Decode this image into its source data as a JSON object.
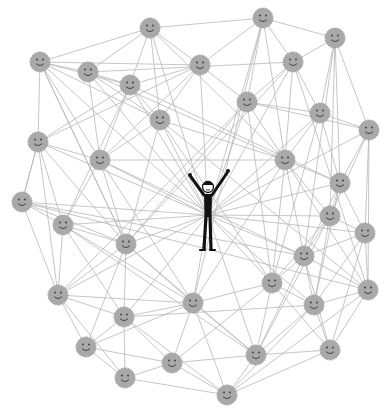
{
  "illustration": {
    "subject": "network of smiling people around a central cheering figure",
    "colors": {
      "background": "#ffffff",
      "edge": "#b8b8b8",
      "node_fill": "#a9a9a9",
      "node_stroke": "#9a9a9a",
      "face_ink": "#3a3a3a",
      "figure": "#111111"
    },
    "node_radius": 10,
    "center_figure": {
      "x": 208,
      "y": 215,
      "label": "central-person"
    },
    "nodes": [
      {
        "x": 150,
        "y": 28
      },
      {
        "x": 263,
        "y": 18
      },
      {
        "x": 335,
        "y": 38
      },
      {
        "x": 40,
        "y": 62
      },
      {
        "x": 88,
        "y": 72
      },
      {
        "x": 200,
        "y": 65
      },
      {
        "x": 293,
        "y": 62
      },
      {
        "x": 130,
        "y": 85
      },
      {
        "x": 247,
        "y": 102
      },
      {
        "x": 320,
        "y": 113
      },
      {
        "x": 369,
        "y": 130
      },
      {
        "x": 160,
        "y": 120
      },
      {
        "x": 38,
        "y": 142
      },
      {
        "x": 100,
        "y": 160
      },
      {
        "x": 285,
        "y": 160
      },
      {
        "x": 340,
        "y": 183
      },
      {
        "x": 22,
        "y": 202
      },
      {
        "x": 330,
        "y": 216
      },
      {
        "x": 63,
        "y": 225
      },
      {
        "x": 365,
        "y": 233
      },
      {
        "x": 126,
        "y": 244
      },
      {
        "x": 304,
        "y": 256
      },
      {
        "x": 272,
        "y": 283
      },
      {
        "x": 58,
        "y": 295
      },
      {
        "x": 193,
        "y": 303
      },
      {
        "x": 314,
        "y": 305
      },
      {
        "x": 368,
        "y": 290
      },
      {
        "x": 124,
        "y": 317
      },
      {
        "x": 86,
        "y": 347
      },
      {
        "x": 256,
        "y": 355
      },
      {
        "x": 330,
        "y": 350
      },
      {
        "x": 125,
        "y": 378
      },
      {
        "x": 172,
        "y": 363
      },
      {
        "x": 227,
        "y": 395
      }
    ],
    "edges": [
      [
        0,
        3
      ],
      [
        0,
        4
      ],
      [
        0,
        5
      ],
      [
        0,
        7
      ],
      [
        0,
        11
      ],
      [
        0,
        1
      ],
      [
        0,
        14
      ],
      [
        1,
        2
      ],
      [
        1,
        5
      ],
      [
        1,
        6
      ],
      [
        1,
        8
      ],
      [
        1,
        14
      ],
      [
        1,
        24
      ],
      [
        2,
        6
      ],
      [
        2,
        9
      ],
      [
        2,
        10
      ],
      [
        2,
        15
      ],
      [
        2,
        17
      ],
      [
        2,
        21
      ],
      [
        3,
        4
      ],
      [
        3,
        5
      ],
      [
        3,
        7
      ],
      [
        3,
        12
      ],
      [
        3,
        11
      ],
      [
        3,
        13
      ],
      [
        3,
        20
      ],
      [
        4,
        7
      ],
      [
        4,
        11
      ],
      [
        4,
        13
      ],
      [
        4,
        6
      ],
      [
        4,
        14
      ],
      [
        5,
        7
      ],
      [
        5,
        11
      ],
      [
        5,
        8
      ],
      [
        5,
        13
      ],
      [
        5,
        12
      ],
      [
        6,
        8
      ],
      [
        6,
        9
      ],
      [
        6,
        14
      ],
      [
        6,
        20
      ],
      [
        7,
        11
      ],
      [
        7,
        13
      ],
      [
        7,
        12
      ],
      [
        7,
        18
      ],
      [
        7,
        15
      ],
      [
        8,
        9
      ],
      [
        8,
        14
      ],
      [
        8,
        10
      ],
      [
        8,
        20
      ],
      [
        8,
        23
      ],
      [
        9,
        10
      ],
      [
        9,
        14
      ],
      [
        9,
        15
      ],
      [
        9,
        22
      ],
      [
        10,
        15
      ],
      [
        10,
        17
      ],
      [
        10,
        19
      ],
      [
        10,
        26
      ],
      [
        11,
        13
      ],
      [
        11,
        14
      ],
      [
        11,
        20
      ],
      [
        11,
        22
      ],
      [
        12,
        13
      ],
      [
        12,
        16
      ],
      [
        12,
        18
      ],
      [
        12,
        23
      ],
      [
        12,
        20
      ],
      [
        13,
        18
      ],
      [
        13,
        20
      ],
      [
        13,
        14
      ],
      [
        13,
        24
      ],
      [
        14,
        15
      ],
      [
        14,
        17
      ],
      [
        14,
        21
      ],
      [
        14,
        22
      ],
      [
        14,
        24
      ],
      [
        14,
        26
      ],
      [
        15,
        17
      ],
      [
        15,
        19
      ],
      [
        15,
        21
      ],
      [
        15,
        25
      ],
      [
        16,
        18
      ],
      [
        16,
        23
      ],
      [
        16,
        20
      ],
      [
        16,
        26
      ],
      [
        17,
        19
      ],
      [
        17,
        21
      ],
      [
        17,
        22
      ],
      [
        17,
        25
      ],
      [
        17,
        29
      ],
      [
        18,
        20
      ],
      [
        18,
        23
      ],
      [
        18,
        24
      ],
      [
        18,
        27
      ],
      [
        19,
        21
      ],
      [
        19,
        25
      ],
      [
        19,
        26
      ],
      [
        19,
        30
      ],
      [
        20,
        24
      ],
      [
        20,
        27
      ],
      [
        20,
        23
      ],
      [
        20,
        28
      ],
      [
        20,
        29
      ],
      [
        21,
        22
      ],
      [
        21,
        25
      ],
      [
        21,
        26
      ],
      [
        21,
        30
      ],
      [
        21,
        29
      ],
      [
        22,
        25
      ],
      [
        22,
        24
      ],
      [
        22,
        29
      ],
      [
        22,
        30
      ],
      [
        22,
        32
      ],
      [
        23,
        27
      ],
      [
        23,
        28
      ],
      [
        23,
        31
      ],
      [
        23,
        24
      ],
      [
        24,
        27
      ],
      [
        24,
        28
      ],
      [
        24,
        32
      ],
      [
        24,
        33
      ],
      [
        24,
        29
      ],
      [
        25,
        26
      ],
      [
        25,
        30
      ],
      [
        25,
        29
      ],
      [
        25,
        33
      ],
      [
        26,
        30
      ],
      [
        26,
        33
      ],
      [
        27,
        28
      ],
      [
        27,
        31
      ],
      [
        27,
        32
      ],
      [
        27,
        33
      ],
      [
        27,
        25
      ],
      [
        28,
        31
      ],
      [
        28,
        32
      ],
      [
        29,
        30
      ],
      [
        29,
        33
      ],
      [
        29,
        32
      ],
      [
        30,
        33
      ],
      [
        31,
        32
      ],
      [
        31,
        33
      ],
      [
        32,
        33
      ],
      [
        12,
        16
      ],
      [
        16,
        21
      ],
      [
        18,
        29
      ],
      [
        13,
        21
      ],
      [
        11,
        26
      ],
      [
        8,
        22
      ],
      [
        6,
        26
      ],
      [
        3,
        20
      ]
    ],
    "hub_edges_from_figure": [
      0,
      1,
      4,
      5,
      7,
      8,
      11,
      13,
      14,
      16,
      17,
      20,
      21,
      22,
      24,
      15,
      9,
      12,
      18,
      23,
      27,
      29,
      25,
      19,
      3,
      6,
      10
    ]
  }
}
